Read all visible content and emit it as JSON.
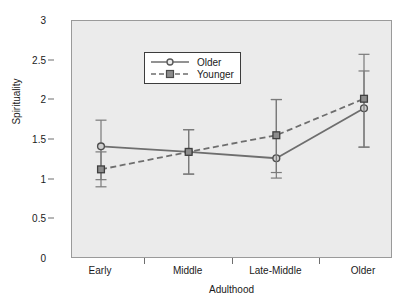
{
  "chart_data": {
    "type": "line",
    "title": "",
    "xlabel": "Adulthood",
    "ylabel": "Spirituality",
    "categories": [
      "Early",
      "Middle",
      "Late-Middle",
      "Older"
    ],
    "ylim": [
      0,
      3
    ],
    "yticks": [
      "0",
      "0.5",
      "1",
      "1.5",
      "2",
      "2.5",
      "3"
    ],
    "ytick_values": [
      0,
      0.5,
      1,
      1.5,
      2,
      2.5,
      3
    ],
    "grid": false,
    "legend_position": "top-left",
    "error_bars": "visible",
    "series": [
      {
        "name": "Older",
        "line_style": "solid",
        "marker": "circle",
        "color": "#6e6e6e",
        "values": [
          1.42,
          1.35,
          1.27,
          1.9
        ],
        "error_low": [
          1.0,
          1.07,
          1.02,
          1.41
        ],
        "error_high": [
          1.75,
          1.63,
          2.01,
          2.58
        ]
      },
      {
        "name": "Younger",
        "line_style": "dashed",
        "marker": "square",
        "color": "#6e6e6e",
        "values": [
          1.13,
          1.35,
          1.56,
          2.02
        ],
        "error_low": [
          0.91,
          1.07,
          1.09,
          1.41
        ],
        "error_high": [
          1.35,
          1.63,
          2.01,
          2.37
        ]
      }
    ]
  },
  "axes": {
    "y_title": "Spirituality",
    "x_title": "Adulthood"
  },
  "legend": {
    "items": [
      {
        "label": "Older"
      },
      {
        "label": "Younger"
      }
    ]
  },
  "colors": {
    "plot_background": "#ebebeb",
    "plot_border": "#9a9a9a",
    "series_line": "#6e6e6e",
    "text": "#1a1a1a",
    "legend_background": "#ffffff",
    "legend_border": "#3c3c3c"
  }
}
